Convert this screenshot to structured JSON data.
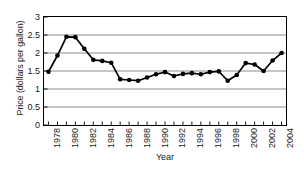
{
  "chart_data": {
    "type": "line",
    "title": "",
    "xlabel": "Year",
    "ylabel": "Price (dollars per gallon)",
    "xlim": [
      1977.5,
      2004.5
    ],
    "ylim": [
      0,
      3
    ],
    "grid": true,
    "legend": "none",
    "marker": "filled-circle",
    "line_color": "#000000",
    "grid_color": "#808080",
    "axis_color": "#000000",
    "ytick_labels": [
      "3",
      "2.5",
      "2",
      "1.5",
      "1",
      "0.5",
      "0"
    ],
    "ytick_values": [
      3,
      2.5,
      2,
      1.5,
      1,
      0.5,
      0
    ],
    "xtick_labels": [
      "1978",
      "1980",
      "1982",
      "1984",
      "1986",
      "1988",
      "1990",
      "1992",
      "1994",
      "1996",
      "1998",
      "2000",
      "2002",
      "2004"
    ],
    "xtick_values": [
      1978,
      1980,
      1982,
      1984,
      1986,
      1988,
      1990,
      1992,
      1994,
      1996,
      1998,
      2000,
      2002,
      2004
    ],
    "x": [
      1978,
      1979,
      1980,
      1981,
      1982,
      1983,
      1984,
      1985,
      1986,
      1987,
      1988,
      1989,
      1990,
      1991,
      1992,
      1993,
      1994,
      1995,
      1996,
      1997,
      1998,
      1999,
      2000,
      2001,
      2002,
      2003,
      2004
    ],
    "values": [
      1.48,
      1.93,
      2.45,
      2.44,
      2.12,
      1.81,
      1.78,
      1.73,
      1.27,
      1.25,
      1.23,
      1.32,
      1.41,
      1.47,
      1.36,
      1.42,
      1.44,
      1.41,
      1.47,
      1.49,
      1.23,
      1.39,
      1.72,
      1.68,
      1.5,
      1.79,
      2.0
    ],
    "series_name": "Price (dollars per gallon)"
  }
}
